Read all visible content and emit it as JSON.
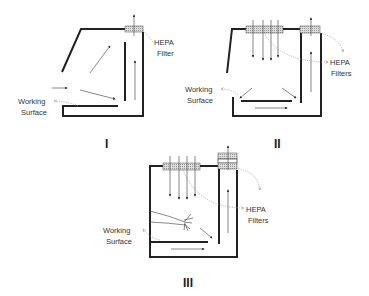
{
  "diagrams": [
    {
      "id": "I",
      "label": "I",
      "filter_label_line1": "HEPA",
      "filter_label_line2": "Filter",
      "surface_label_line1": "Working",
      "surface_label_line2": "Surface"
    },
    {
      "id": "II",
      "label": "II",
      "filter_label_line1": "HEPA",
      "filter_label_line2": "Filters",
      "surface_label_line1": "Working",
      "surface_label_line2": "Surface"
    },
    {
      "id": "III",
      "label": "III",
      "filter_label_line1": "HEPA",
      "filter_label_line2": "Filters",
      "surface_label_line1": "Working",
      "surface_label_line2": "Surface"
    }
  ],
  "colors": {
    "wall": "#222222",
    "arrow": "#555555",
    "leader": "#999999",
    "filter_fill": "#cccccc"
  }
}
